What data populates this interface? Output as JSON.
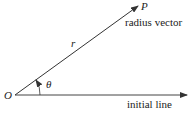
{
  "diagram": {
    "origin_label": "O",
    "point_label": "P",
    "radius_label": "r",
    "angle_label": "θ",
    "radius_vector_label": "radius vector",
    "initial_line_label": "initial line"
  },
  "colors": {
    "line": "#333333",
    "text": "#222222",
    "background": "#ffffff"
  }
}
